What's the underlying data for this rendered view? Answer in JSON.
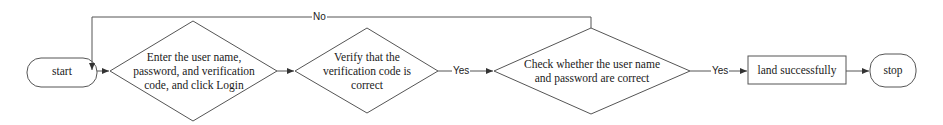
{
  "diagram": {
    "type": "flowchart",
    "direction": "left-to-right",
    "nodes": [
      {
        "id": "start",
        "shape": "terminator",
        "label": "start"
      },
      {
        "id": "enter",
        "shape": "decision",
        "lines": [
          "Enter the user name,",
          "password, and verification",
          "code, and click Login"
        ]
      },
      {
        "id": "verify",
        "shape": "decision",
        "lines": [
          "Verify that the",
          "verification code is",
          "correct"
        ]
      },
      {
        "id": "check",
        "shape": "decision",
        "lines": [
          "Check whether the user name",
          "and password are correct"
        ]
      },
      {
        "id": "success",
        "shape": "process",
        "label": "land successfully"
      },
      {
        "id": "stop",
        "shape": "terminator",
        "label": "stop"
      }
    ],
    "edges": [
      {
        "from": "start",
        "to": "enter",
        "label": ""
      },
      {
        "from": "enter",
        "to": "verify",
        "label": ""
      },
      {
        "from": "verify",
        "to": "check",
        "label": "Yes"
      },
      {
        "from": "check",
        "to": "success",
        "label": "Yes"
      },
      {
        "from": "success",
        "to": "stop",
        "label": ""
      },
      {
        "from": "check",
        "to": "enter",
        "label": "No",
        "route": "loop-back-over-top"
      }
    ],
    "edge_labels": {
      "no": "No",
      "yes1": "Yes",
      "yes2": "Yes"
    },
    "colors": {
      "stroke": "#555555",
      "text": "#1a1a1a",
      "background": "#ffffff"
    }
  }
}
